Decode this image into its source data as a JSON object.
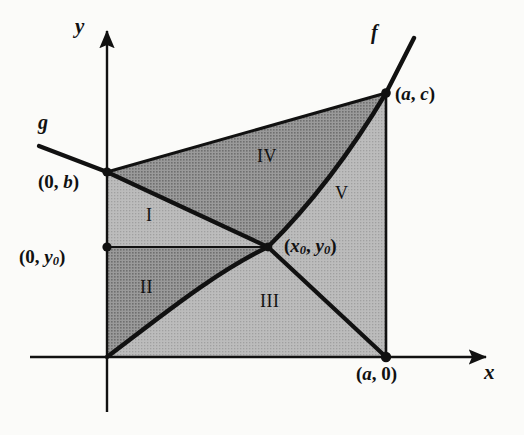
{
  "figure": {
    "kind": "region-diagram",
    "background_color": "#fbfbf9",
    "ink_color": "#111111",
    "shade_dark_color": "#8f8f8f",
    "shade_light_color": "#b4b4b4"
  },
  "axes": {
    "x_label": "x",
    "y_label": "y",
    "origin": {
      "x": 107,
      "y": 357
    },
    "x_axis": {
      "from_x": 30,
      "to_x": 492,
      "y": 357,
      "arrow": "right"
    },
    "y_axis": {
      "x": 107,
      "from_y": 412,
      "to_y": 25,
      "arrow": "up"
    }
  },
  "curves": [
    {
      "name": "f",
      "label": "f",
      "label_pos": {
        "x": 371,
        "y": 28
      },
      "style": "increasing-concave-up",
      "description": "increasing curve through origin, (x0, y0) and (a, c), continuing beyond (a, c)"
    },
    {
      "name": "g",
      "label": "g",
      "label_pos": {
        "x": 38,
        "y": 118
      },
      "style": "decreasing-line",
      "description": "decreasing line entering at upper left, through (0, b) and (x0, y0), reaching (a, 0)"
    }
  ],
  "points": [
    {
      "name": "point-0-b",
      "label_open": "(0, ",
      "label_var": "b",
      "label_close": ")",
      "at": {
        "x": 107,
        "y": 172
      },
      "label_pos": {
        "x": 38,
        "y": 176
      },
      "dot": true
    },
    {
      "name": "point-0-y0",
      "label_open": "(0, ",
      "label_var": "y",
      "label_sub": "0",
      "label_close": ")",
      "at": {
        "x": 107,
        "y": 247
      },
      "label_pos": {
        "x": 19,
        "y": 251
      },
      "dot": true
    },
    {
      "name": "point-x0-y0",
      "label_open": "(",
      "label_var": "x",
      "label_sub": "0",
      "label_mid": ", ",
      "label_var2": "y",
      "label_sub2": "0",
      "label_close": ")",
      "at": {
        "x": 268,
        "y": 247
      },
      "label_pos": {
        "x": 284,
        "y": 240
      },
      "dot": true
    },
    {
      "name": "point-a-c",
      "label_open": "(",
      "label_var": "a",
      "label_mid": ", ",
      "label_var2": "c",
      "label_close": ")",
      "at": {
        "x": 386,
        "y": 93
      },
      "label_pos": {
        "x": 395,
        "y": 88
      },
      "dot": true
    },
    {
      "name": "point-a-0",
      "label_open": "(",
      "label_var": "a",
      "label_mid": ", ",
      "label_plain": "0",
      "label_close": ")",
      "at": {
        "x": 386,
        "y": 357
      },
      "label_pos": {
        "x": 356,
        "y": 366
      },
      "dot": true
    }
  ],
  "regions": [
    {
      "name": "region-I",
      "label": "I",
      "shade": "light",
      "label_pos": {
        "x": 146,
        "y": 214
      }
    },
    {
      "name": "region-II",
      "label": "II",
      "shade": "dark",
      "label_pos": {
        "x": 140,
        "y": 286
      }
    },
    {
      "name": "region-III",
      "label": "III",
      "shade": "light",
      "label_pos": {
        "x": 260,
        "y": 300
      }
    },
    {
      "name": "region-IV",
      "label": "IV",
      "shade": "dark",
      "label_pos": {
        "x": 257,
        "y": 155
      }
    },
    {
      "name": "region-V",
      "label": "V",
      "shade": "light",
      "label_pos": {
        "x": 335,
        "y": 192
      }
    }
  ]
}
